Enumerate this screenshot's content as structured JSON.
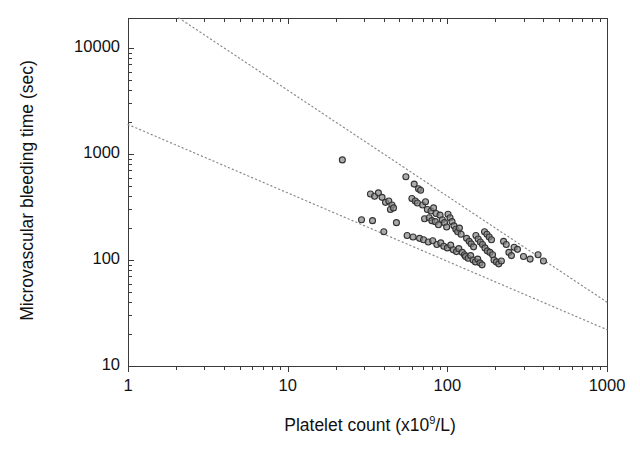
{
  "chart_data": {
    "type": "scatter",
    "title": "",
    "xlabel": "Platelet count (x10⁹/L)",
    "ylabel": "Microvascular bleeding time (sec)",
    "xscale": "log",
    "yscale": "log",
    "xlim": [
      1,
      1000
    ],
    "ylim": [
      10,
      20000
    ],
    "grid": false,
    "legend": null,
    "xticks": [
      1,
      10,
      100,
      1000
    ],
    "xtick_labels": [
      "1",
      "10",
      "100",
      "1000"
    ],
    "yticks": [
      10,
      100,
      1000,
      10000
    ],
    "ytick_labels": [
      "10",
      "100",
      "1000",
      "10000"
    ],
    "marker": {
      "shape": "circle",
      "size_px": 6,
      "fill": "#8a8a8a",
      "edge": "#333333"
    },
    "reference_lines": [
      {
        "name": "upper-bound",
        "style": "dotted",
        "color": "#8a8a8a",
        "points": [
          [
            2,
            20000
          ],
          [
            1000,
            40
          ]
        ]
      },
      {
        "name": "lower-bound",
        "style": "dotted",
        "color": "#8a8a8a",
        "points": [
          [
            1,
            1900
          ],
          [
            1000,
            22
          ]
        ]
      }
    ],
    "n_points": 96,
    "points": [
      [
        22,
        880
      ],
      [
        55,
        610
      ],
      [
        33,
        420
      ],
      [
        35,
        400
      ],
      [
        37,
        430
      ],
      [
        39,
        390
      ],
      [
        41,
        350
      ],
      [
        43,
        360
      ],
      [
        45,
        330
      ],
      [
        44,
        300
      ],
      [
        46,
        310
      ],
      [
        29,
        240
      ],
      [
        34,
        235
      ],
      [
        40,
        185
      ],
      [
        48,
        225
      ],
      [
        62,
        520
      ],
      [
        66,
        470
      ],
      [
        68,
        455
      ],
      [
        60,
        380
      ],
      [
        63,
        360
      ],
      [
        65,
        345
      ],
      [
        70,
        330
      ],
      [
        73,
        355
      ],
      [
        75,
        300
      ],
      [
        79,
        290
      ],
      [
        82,
        310
      ],
      [
        85,
        275
      ],
      [
        72,
        245
      ],
      [
        77,
        250
      ],
      [
        80,
        235
      ],
      [
        84,
        230
      ],
      [
        88,
        215
      ],
      [
        90,
        265
      ],
      [
        93,
        240
      ],
      [
        96,
        225
      ],
      [
        99,
        205
      ],
      [
        101,
        270
      ],
      [
        104,
        250
      ],
      [
        107,
        230
      ],
      [
        110,
        210
      ],
      [
        113,
        195
      ],
      [
        116,
        185
      ],
      [
        119,
        200
      ],
      [
        122,
        175
      ],
      [
        56,
        170
      ],
      [
        61,
        165
      ],
      [
        67,
        160
      ],
      [
        71,
        155
      ],
      [
        76,
        148
      ],
      [
        81,
        152
      ],
      [
        86,
        140
      ],
      [
        91,
        145
      ],
      [
        95,
        135
      ],
      [
        100,
        130
      ],
      [
        105,
        138
      ],
      [
        109,
        125
      ],
      [
        114,
        120
      ],
      [
        118,
        128
      ],
      [
        124,
        118
      ],
      [
        128,
        112
      ],
      [
        132,
        160
      ],
      [
        137,
        150
      ],
      [
        141,
        142
      ],
      [
        146,
        133
      ],
      [
        151,
        170
      ],
      [
        156,
        158
      ],
      [
        161,
        148
      ],
      [
        166,
        140
      ],
      [
        130,
        108
      ],
      [
        135,
        104
      ],
      [
        140,
        110
      ],
      [
        145,
        100
      ],
      [
        150,
        96
      ],
      [
        155,
        102
      ],
      [
        160,
        94
      ],
      [
        165,
        90
      ],
      [
        171,
        185
      ],
      [
        177,
        175
      ],
      [
        183,
        165
      ],
      [
        189,
        155
      ],
      [
        172,
        130
      ],
      [
        178,
        122
      ],
      [
        185,
        118
      ],
      [
        192,
        112
      ],
      [
        196,
        100
      ],
      [
        203,
        96
      ],
      [
        210,
        92
      ],
      [
        218,
        98
      ],
      [
        225,
        150
      ],
      [
        234,
        140
      ],
      [
        243,
        118
      ],
      [
        252,
        110
      ],
      [
        262,
        132
      ],
      [
        275,
        126
      ],
      [
        300,
        108
      ],
      [
        330,
        102
      ],
      [
        370,
        112
      ],
      [
        400,
        98
      ]
    ]
  },
  "axes": {
    "x_tick_labels": [
      "1",
      "10",
      "100",
      "1000"
    ],
    "y_tick_labels": [
      "10",
      "100",
      "1000",
      "10000"
    ],
    "x_title_main": "Platelet count (x10",
    "x_title_sup": "9",
    "x_title_tail": "/L)",
    "y_title": "Microvascular bleeding time (sec)"
  }
}
